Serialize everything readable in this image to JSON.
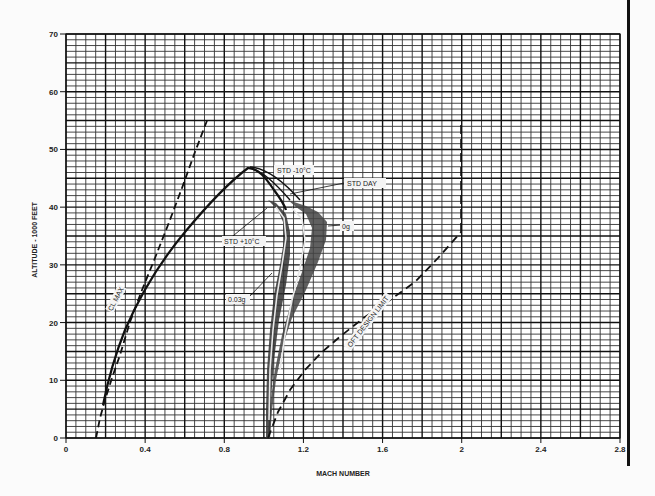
{
  "chart_data": {
    "type": "line",
    "title": "",
    "xlabel": "MACH NUMBER",
    "ylabel": "ALTITUDE - 1000 FEET",
    "xlim": [
      0,
      2.8
    ],
    "ylim": [
      0,
      70
    ],
    "x_ticks": [
      "0",
      "0.4",
      "0.8",
      "1.2",
      "1.6",
      "2",
      "2.4",
      "2.8"
    ],
    "y_ticks": [
      "0",
      "10",
      "20",
      "30",
      "40",
      "50",
      "60",
      "70"
    ],
    "grid": true,
    "grid_minor": {
      "x_step": 0.05,
      "y_step": 1
    },
    "series": [
      {
        "name": "CL MAX",
        "style": "dashed",
        "points": [
          [
            0.15,
            0
          ],
          [
            0.19,
            6
          ],
          [
            0.26,
            14
          ],
          [
            0.32,
            20
          ],
          [
            0.38,
            28
          ],
          [
            0.46,
            35
          ],
          [
            0.55,
            44
          ],
          [
            0.64,
            50
          ],
          [
            0.72,
            55.5
          ]
        ]
      },
      {
        "name": "STD +10°C",
        "style": "solid",
        "points": [
          [
            0.19,
            6
          ],
          [
            0.26,
            15
          ],
          [
            0.37,
            25
          ],
          [
            0.55,
            35
          ],
          [
            0.75,
            43
          ],
          [
            0.92,
            46.5
          ],
          [
            1.0,
            44
          ],
          [
            1.05,
            41
          ],
          [
            1.08,
            38
          ],
          [
            1.08,
            30
          ],
          [
            1.06,
            20
          ],
          [
            1.03,
            10
          ],
          [
            1.01,
            0
          ]
        ]
      },
      {
        "name": "STD DAY",
        "style": "solid",
        "points": [
          [
            0.92,
            46.5
          ],
          [
            1.02,
            44
          ],
          [
            1.09,
            41
          ],
          [
            1.13,
            38
          ],
          [
            1.13,
            30
          ],
          [
            1.1,
            20
          ],
          [
            1.06,
            10
          ],
          [
            1.02,
            0
          ]
        ]
      },
      {
        "name": "STD -10°C",
        "style": "solid",
        "points": [
          [
            0.92,
            46.8
          ],
          [
            1.04,
            44
          ],
          [
            1.12,
            41
          ],
          [
            1.17,
            38
          ],
          [
            1.17,
            30
          ],
          [
            1.13,
            20
          ],
          [
            1.08,
            10
          ],
          [
            1.03,
            0
          ]
        ]
      },
      {
        "name": "0g",
        "style": "shaded",
        "points": [
          [
            1.12,
            41
          ],
          [
            1.22,
            39.5
          ],
          [
            1.3,
            37
          ],
          [
            1.28,
            32
          ],
          [
            1.22,
            25
          ],
          [
            1.15,
            15
          ]
        ]
      },
      {
        "name": "0.03g",
        "style": "shaded",
        "points": [
          [
            1.02,
            41
          ],
          [
            1.08,
            38
          ],
          [
            1.1,
            30
          ],
          [
            1.06,
            20
          ],
          [
            1.03,
            10
          ],
          [
            1.01,
            0
          ]
        ]
      },
      {
        "name": "OFT DESIGN LIMIT",
        "style": "dashed",
        "points": [
          [
            1.02,
            0
          ],
          [
            1.13,
            8
          ],
          [
            1.33,
            16
          ],
          [
            1.58,
            23
          ],
          [
            1.79,
            28.5
          ],
          [
            2.0,
            36
          ],
          [
            2.0,
            54.5
          ]
        ]
      }
    ],
    "annotations": [
      {
        "text": "CL MAX",
        "x": 0.28,
        "y": 25
      },
      {
        "text": "STD -10°C",
        "x": 1.08,
        "y": 45
      },
      {
        "text": "STD DAY",
        "x": 1.42,
        "y": 42
      },
      {
        "text": "STD +10°C",
        "x": 0.88,
        "y": 34
      },
      {
        "text": "0g",
        "x": 1.47,
        "y": 36
      },
      {
        "text": "0.03g",
        "x": 0.85,
        "y": 23.5
      },
      {
        "text": "OFT DESIGN LIMIT",
        "x": 1.55,
        "y": 21
      }
    ]
  },
  "axes": {
    "xlabel": "MACH NUMBER",
    "ylabel": "ALTITUDE - 1000 FEET",
    "x_ticks": [
      "0",
      "0.4",
      "0.8",
      "1.2",
      "1.6",
      "2",
      "2.4",
      "2.8"
    ],
    "y_ticks": [
      "0",
      "10",
      "20",
      "30",
      "40",
      "50",
      "60",
      "70"
    ]
  },
  "labels": {
    "cl_max": "CL MAX",
    "std_minus10": "STD -10°C",
    "std_day": "STD DAY",
    "std_plus10": "STD +10°C",
    "zero_g": "0g",
    "g003": "0.03g",
    "oft_limit": "OFT DESIGN LIMIT"
  }
}
